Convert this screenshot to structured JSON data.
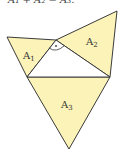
{
  "caption": "A₁ + A₂ = A₃.",
  "diagram": {
    "type": "right-triangle-with-similar-figures",
    "fill_color": "#fbf3b8",
    "stroke_color": "#3a3a3a",
    "background": "#ffffff",
    "regions": [
      {
        "id": "A1",
        "label": "A",
        "subscript": "1",
        "points": [
          [
            7,
            37
          ],
          [
            56,
            40
          ],
          [
            27,
            77
          ]
        ],
        "label_pos": [
          23,
          56
        ]
      },
      {
        "id": "A2",
        "label": "A",
        "subscript": "2",
        "points": [
          [
            56,
            40
          ],
          [
            117,
            11
          ],
          [
            110,
            77
          ]
        ],
        "label_pos": [
          89,
          44
        ]
      },
      {
        "id": "A3",
        "label": "A",
        "subscript": "3",
        "points": [
          [
            27,
            77
          ],
          [
            110,
            77
          ],
          [
            69,
            149
          ]
        ],
        "label_pos": [
          63,
          109
        ]
      }
    ],
    "central_triangle": [
      [
        56,
        40
      ],
      [
        27,
        77
      ],
      [
        110,
        77
      ]
    ],
    "right_angle_marker": {
      "vertex": [
        56,
        40
      ],
      "dot": true
    }
  }
}
